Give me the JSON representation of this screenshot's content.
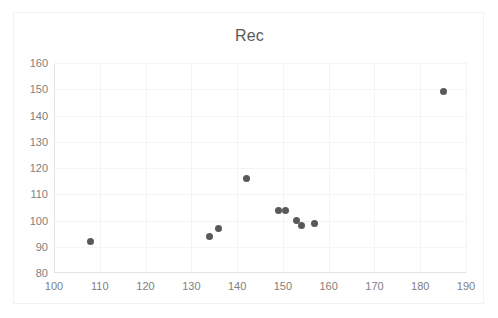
{
  "chart_data": {
    "type": "scatter",
    "title": "Rec",
    "xlabel": "",
    "ylabel": "",
    "xlim": [
      100,
      190
    ],
    "ylim": [
      80,
      160
    ],
    "xticks": [
      100,
      110,
      120,
      130,
      140,
      150,
      160,
      170,
      180,
      190
    ],
    "yticks": [
      80,
      90,
      100,
      110,
      120,
      130,
      140,
      150,
      160
    ],
    "grid": true,
    "legend": "none",
    "marker_color": "#595959",
    "series": [
      {
        "name": "Rec",
        "points": [
          {
            "x": 108,
            "y": 92
          },
          {
            "x": 134,
            "y": 94
          },
          {
            "x": 136,
            "y": 97
          },
          {
            "x": 142,
            "y": 116
          },
          {
            "x": 149,
            "y": 104
          },
          {
            "x": 150.5,
            "y": 104
          },
          {
            "x": 153,
            "y": 100
          },
          {
            "x": 154,
            "y": 98
          },
          {
            "x": 157,
            "y": 99
          },
          {
            "x": 185,
            "y": 149
          }
        ]
      }
    ]
  }
}
